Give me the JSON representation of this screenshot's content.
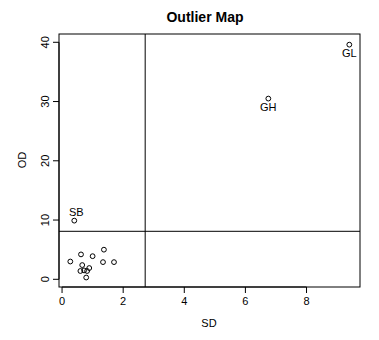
{
  "chart_data": {
    "type": "scatter",
    "title": "Outlier Map",
    "xlabel": "SD",
    "ylabel": "OD",
    "xlim": [
      -0.1,
      9.75
    ],
    "ylim": [
      -1.3,
      41.4
    ],
    "xticks": [
      0,
      2,
      4,
      6,
      8
    ],
    "yticks": [
      0,
      10,
      20,
      30,
      40
    ],
    "grid": false,
    "legend": null,
    "cutoffs": {
      "sd": 2.72,
      "od": 8.1
    },
    "points": [
      {
        "x": 9.4,
        "y": 39.6,
        "label": "GL"
      },
      {
        "x": 6.75,
        "y": 30.5,
        "label": "GH"
      },
      {
        "x": 0.4,
        "y": 9.9,
        "label": "SB"
      },
      {
        "x": 0.27,
        "y": 3.0,
        "label": ""
      },
      {
        "x": 0.62,
        "y": 4.2,
        "label": ""
      },
      {
        "x": 1.0,
        "y": 3.9,
        "label": ""
      },
      {
        "x": 1.37,
        "y": 5.0,
        "label": ""
      },
      {
        "x": 0.66,
        "y": 2.4,
        "label": ""
      },
      {
        "x": 1.34,
        "y": 2.9,
        "label": ""
      },
      {
        "x": 1.7,
        "y": 2.9,
        "label": ""
      },
      {
        "x": 0.6,
        "y": 1.4,
        "label": ""
      },
      {
        "x": 0.72,
        "y": 1.5,
        "label": ""
      },
      {
        "x": 0.82,
        "y": 1.4,
        "label": ""
      },
      {
        "x": 0.89,
        "y": 1.9,
        "label": ""
      },
      {
        "x": 0.79,
        "y": 0.3,
        "label": ""
      }
    ]
  }
}
